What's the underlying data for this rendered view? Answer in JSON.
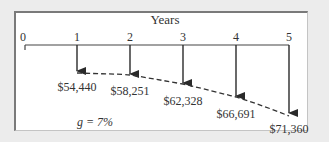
{
  "title": "Years",
  "timeline": {
    "ticks": [
      "0",
      "1",
      "2",
      "3",
      "4",
      "5"
    ]
  },
  "cash_flows": [
    {
      "year": "1",
      "label": "$54,440"
    },
    {
      "year": "2",
      "label": "$58,251"
    },
    {
      "year": "3",
      "label": "$62,328"
    },
    {
      "year": "4",
      "label": "$66,691"
    },
    {
      "year": "5",
      "label": "$71,360"
    }
  ],
  "growth_label": "g = 7%",
  "colors": {
    "background": "#ececec",
    "panel": "#ffffff",
    "lines": "#333333"
  }
}
